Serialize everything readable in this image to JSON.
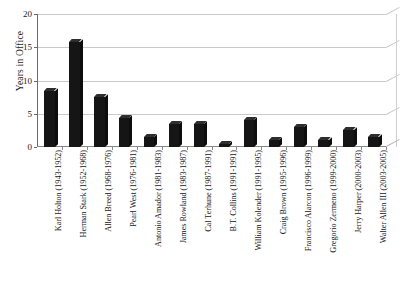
{
  "chart_data": {
    "type": "bar",
    "title": "",
    "subtitle": "",
    "xlabel": "",
    "ylabel": "Years in Office",
    "ylim": [
      0,
      20
    ],
    "yticks": [
      0,
      5,
      10,
      15,
      20
    ],
    "ytick_labels": [
      "0",
      "5",
      "10",
      "15",
      "20"
    ],
    "grid": true,
    "legend": false,
    "legend_position": "none",
    "orientation": "vertical",
    "bar_color": "#151515",
    "background_color": "#ffffff",
    "gridline_color": "#c9c9c9",
    "axis_color": "#6a6a6a",
    "style_note": "3d-perspective-bars",
    "categories": [
      "Karl Holton (1943-1952)",
      "Herman Stark (1952-1968)",
      "Allen Breed (1968-1976)",
      "Pearl West (1976-1981)",
      "Antonio Amador (1981-1983)",
      "James Rowland (1983-1987)",
      "Cal Terhune (1987-1991)",
      "B.T. Collins (1991-1991)",
      "William Kolender (1991-1995)",
      "Craig Brown (1995-1996)",
      "Francisco Alarcon (1996-1999)",
      "Gregorio Zermeno (1999-2000)",
      "Jerry Harper (2000-2003)",
      "Walter Allen III (2003-2005)"
    ],
    "values": [
      8.4,
      15.8,
      7.5,
      4.3,
      1.5,
      3.5,
      3.5,
      0.5,
      4.0,
      1.0,
      3.0,
      1.0,
      2.5,
      1.5
    ]
  }
}
